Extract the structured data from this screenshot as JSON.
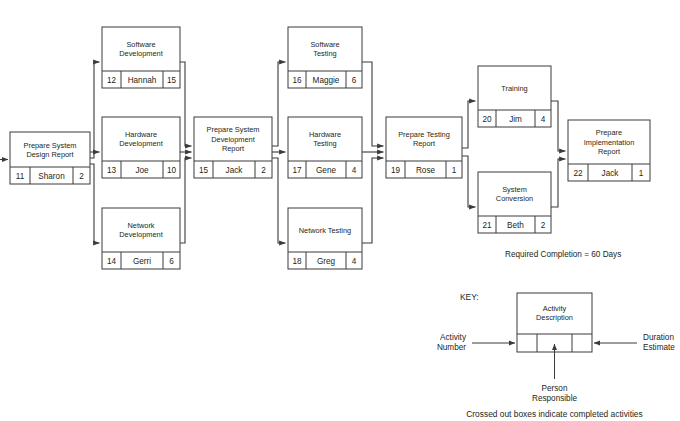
{
  "diagram": {
    "annotation": "Required Completion = 60 Days",
    "footnote": "Crossed out boxes indicate completed activities",
    "colors": {
      "line": "#3a3a3a",
      "text": "#231f20",
      "box_fill": "#ffffff"
    },
    "columns": [
      {
        "name": "design",
        "label": "Design"
      },
      {
        "name": "development",
        "label": "Development"
      },
      {
        "name": "integration",
        "label": "Integration"
      },
      {
        "name": "testing",
        "label": "Testing"
      },
      {
        "name": "report",
        "label": "Report"
      },
      {
        "name": "deployment",
        "label": "Deployment"
      },
      {
        "name": "closeout",
        "label": "Closeout"
      }
    ],
    "nodes": [
      {
        "id": "n11",
        "title": "Prepare System Design Report",
        "number": "11",
        "person": "Sharon",
        "duration": "2",
        "x": 10,
        "y": 132,
        "w": 80,
        "h": 52,
        "rowH": 17
      },
      {
        "id": "n12",
        "title": "Software Development",
        "number": "12",
        "person": "Hannah",
        "duration": "15",
        "x": 102,
        "y": 27,
        "w": 78,
        "h": 61,
        "rowH": 17
      },
      {
        "id": "n13",
        "title": "Hardware Development",
        "number": "13",
        "person": "Joe",
        "duration": "10",
        "x": 102,
        "y": 117,
        "w": 78,
        "h": 61,
        "rowH": 17
      },
      {
        "id": "n14",
        "title": "Network Development",
        "number": "14",
        "person": "Gerri",
        "duration": "6",
        "x": 102,
        "y": 208,
        "w": 78,
        "h": 61,
        "rowH": 17
      },
      {
        "id": "n15",
        "title": "Prepare System Development Report",
        "number": "15",
        "person": "Jack",
        "duration": "2",
        "x": 194,
        "y": 117,
        "w": 78,
        "h": 61,
        "rowH": 17
      },
      {
        "id": "n16",
        "title": "Software Testing",
        "number": "16",
        "person": "Maggie",
        "duration": "6",
        "x": 288,
        "y": 27,
        "w": 74,
        "h": 61,
        "rowH": 17
      },
      {
        "id": "n17",
        "title": "Hardware Testing",
        "number": "17",
        "person": "Gene",
        "duration": "4",
        "x": 288,
        "y": 117,
        "w": 74,
        "h": 61,
        "rowH": 17
      },
      {
        "id": "n18",
        "title": "Network Testing",
        "number": "18",
        "person": "Greg",
        "duration": "4",
        "x": 288,
        "y": 208,
        "w": 74,
        "h": 61,
        "rowH": 17
      },
      {
        "id": "n19",
        "title": "Prepare Testing Report",
        "number": "19",
        "person": "Rose",
        "duration": "1",
        "x": 386,
        "y": 117,
        "w": 76,
        "h": 61,
        "rowH": 17
      },
      {
        "id": "n20",
        "title": "Training",
        "number": "20",
        "person": "Jim",
        "duration": "4",
        "x": 478,
        "y": 66,
        "w": 73,
        "h": 61,
        "rowH": 17
      },
      {
        "id": "n21",
        "title": "System Conversion",
        "number": "21",
        "person": "Beth",
        "duration": "2",
        "x": 478,
        "y": 172,
        "w": 73,
        "h": 61,
        "rowH": 17
      },
      {
        "id": "n22",
        "title": "Prepare Implementation Report",
        "number": "22",
        "person": "Jack",
        "duration": "1",
        "x": 568,
        "y": 120,
        "w": 82,
        "h": 61,
        "rowH": 17
      }
    ],
    "edges": [
      {
        "from": "start",
        "to": "n11",
        "label": "entry arrow into Prepare System Design Report"
      },
      {
        "from": "n11",
        "to": "n12",
        "label": "Prepare System Design Report to Software Development"
      },
      {
        "from": "n11",
        "to": "n13",
        "label": "Prepare System Design Report to Hardware Development"
      },
      {
        "from": "n11",
        "to": "n14",
        "label": "Prepare System Design Report to Network Development"
      },
      {
        "from": "n12",
        "to": "n15",
        "label": "Software Development to Prepare System Development Report"
      },
      {
        "from": "n13",
        "to": "n15",
        "label": "Hardware Development to Prepare System Development Report"
      },
      {
        "from": "n14",
        "to": "n15",
        "label": "Network Development to Prepare System Development Report"
      },
      {
        "from": "n15",
        "to": "n16",
        "label": "Prepare System Development Report to Software Testing"
      },
      {
        "from": "n15",
        "to": "n17",
        "label": "Prepare System Development Report to Hardware Testing"
      },
      {
        "from": "n15",
        "to": "n18",
        "label": "Prepare System Development Report to Network Testing"
      },
      {
        "from": "n16",
        "to": "n19",
        "label": "Software Testing to Prepare Testing Report"
      },
      {
        "from": "n17",
        "to": "n19",
        "label": "Hardware Testing to Prepare Testing Report"
      },
      {
        "from": "n18",
        "to": "n19",
        "label": "Network Testing to Prepare Testing Report"
      },
      {
        "from": "n19",
        "to": "n20",
        "label": "Prepare Testing Report to Training"
      },
      {
        "from": "n19",
        "to": "n21",
        "label": "Prepare Testing Report to System Conversion"
      },
      {
        "from": "n20",
        "to": "n22",
        "label": "Training to Prepare Implementation Report"
      },
      {
        "from": "n21",
        "to": "n22",
        "label": "System Conversion to Prepare Implementation Report"
      }
    ],
    "legend": {
      "heading": "KEY:",
      "box_title": "Activity Description",
      "left_label_line1": "Activity",
      "left_label_line2": "Number",
      "right_label_line1": "Duration",
      "right_label_line2": "Estimate",
      "bottom_label_line1": "Person",
      "bottom_label_line2": "Responsible"
    }
  }
}
